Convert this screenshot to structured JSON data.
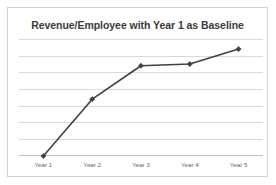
{
  "chart_data": {
    "type": "line",
    "title": "Revenue/Employee with Year 1 as Baseline",
    "xlabel": "",
    "ylabel": "",
    "categories": [
      "Year 1",
      "Year 2",
      "Year 3",
      "Year 4",
      "Year 5"
    ],
    "values": [
      1.0,
      2.7,
      3.7,
      3.75,
      4.2
    ],
    "series": [
      {
        "name": "Revenue/Employee",
        "values": [
          1.0,
          2.7,
          3.7,
          3.75,
          4.2
        ],
        "color": "#404040",
        "marker": "diamond"
      }
    ],
    "ylim": [
      1.0,
      4.5
    ],
    "gridlines": 8,
    "grid": true,
    "y_tick_labels": [],
    "legend": false,
    "legend_position": "none",
    "annotations": []
  },
  "colors": {
    "frame_border": "#d2d2d2",
    "gridline": "#d9d9d9",
    "axis_line": "#bdbdbd",
    "series_line": "#404040",
    "title_text": "#3b3b3b",
    "tick_text": "#666666",
    "background": "#ffffff"
  }
}
